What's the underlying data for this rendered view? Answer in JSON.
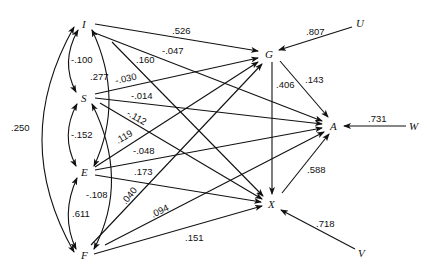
{
  "diagram": {
    "type": "path-diagram",
    "nodes": [
      {
        "id": "I",
        "label": "I",
        "x": 85,
        "y": 24
      },
      {
        "id": "S",
        "label": "S",
        "x": 85,
        "y": 98
      },
      {
        "id": "E",
        "label": "E",
        "x": 85,
        "y": 172
      },
      {
        "id": "F",
        "label": "F",
        "x": 85,
        "y": 255
      },
      {
        "id": "G",
        "label": "G",
        "x": 270,
        "y": 53
      },
      {
        "id": "A",
        "label": "A",
        "x": 334,
        "y": 126
      },
      {
        "id": "X",
        "label": "X",
        "x": 273,
        "y": 204
      },
      {
        "id": "U",
        "label": "U",
        "x": 360,
        "y": 23
      },
      {
        "id": "W",
        "label": "W",
        "x": 415,
        "y": 126
      },
      {
        "id": "V",
        "label": "V",
        "x": 363,
        "y": 253
      }
    ],
    "correlations": [
      {
        "from": "I",
        "to": "S",
        "value": "-.100"
      },
      {
        "from": "S",
        "to": "E",
        "value": "-.152"
      },
      {
        "from": "E",
        "to": "F",
        "value": ".611"
      },
      {
        "from": "I",
        "to": "E",
        "value": ".277"
      },
      {
        "from": "S",
        "to": "F",
        "value": "-.108"
      },
      {
        "from": "I",
        "to": "F",
        "value": ".250"
      }
    ],
    "paths": [
      {
        "from": "I",
        "to": "G",
        "value": ".526"
      },
      {
        "from": "I",
        "to": "A",
        "value": "-.047"
      },
      {
        "from": "I",
        "to": "X",
        "value": ".160"
      },
      {
        "from": "S",
        "to": "G",
        "value": "-.030"
      },
      {
        "from": "S",
        "to": "A",
        "value": "-.014"
      },
      {
        "from": "S",
        "to": "X",
        "value": "-.112"
      },
      {
        "from": "E",
        "to": "G",
        "value": ".119"
      },
      {
        "from": "E",
        "to": "A",
        "value": "-.048"
      },
      {
        "from": "E",
        "to": "X",
        "value": ".173"
      },
      {
        "from": "F",
        "to": "G",
        "value": ".040"
      },
      {
        "from": "F",
        "to": "A",
        "value": ".094"
      },
      {
        "from": "F",
        "to": "X",
        "value": ".151"
      },
      {
        "from": "G",
        "to": "X",
        "value": ".406"
      },
      {
        "from": "G",
        "to": "A",
        "value": ".143"
      },
      {
        "from": "X",
        "to": "A",
        "value": ".588"
      },
      {
        "from": "U",
        "to": "G",
        "value": ".807"
      },
      {
        "from": "W",
        "to": "A",
        "value": ".731"
      },
      {
        "from": "V",
        "to": "X",
        "value": ".718"
      }
    ]
  },
  "labels": {
    "I": "I",
    "S": "S",
    "E": "E",
    "F": "F",
    "G": "G",
    "A": "A",
    "X": "X",
    "U": "U",
    "W": "W",
    "V": "V",
    "c_IS": "-.100",
    "c_SE": "-.152",
    "c_EF": ".611",
    "c_IE": ".277",
    "c_SF": "-.108",
    "c_IF": ".250",
    "p_IG": ".526",
    "p_IA": "-.047",
    "p_IX": ".160",
    "p_SG": "-.030",
    "p_SA": "-.014",
    "p_SX": "-.112",
    "p_EG": ".119",
    "p_EA": "-.048",
    "p_EX": ".173",
    "p_FG": ".040",
    "p_FA": ".094",
    "p_FX": ".151",
    "p_GX": ".406",
    "p_GA": ".143",
    "p_XA": ".588",
    "p_UG": ".807",
    "p_WA": ".731",
    "p_VX": ".718"
  }
}
